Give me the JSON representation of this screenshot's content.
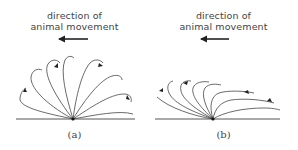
{
  "figure": {
    "panels": [
      {
        "id": "a",
        "label": "(a)",
        "caption_line1": "direction of",
        "caption_line2": "animal movement",
        "arrow_direction": "left",
        "description": "upright loops radiating from a single ground point"
      },
      {
        "id": "b",
        "label": "(b)",
        "caption_line1": "direction of",
        "caption_line2": "animal movement",
        "arrow_direction": "left",
        "description": "loops swept back and flattened toward the ground"
      }
    ],
    "colors": {
      "line": "#333333",
      "text": "#444444",
      "background": "#ffffff"
    }
  }
}
